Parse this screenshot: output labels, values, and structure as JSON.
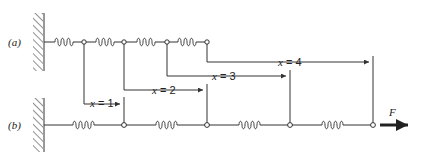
{
  "diagram": {
    "type": "spring-chain",
    "row_a": {
      "label": "(a)",
      "springs": 4,
      "nodes": 4
    },
    "row_b": {
      "label": "(b)",
      "springs": 4,
      "nodes": 4,
      "force_label": "F"
    },
    "dimensions": [
      {
        "label_var": "x",
        "label_eq": " = 1"
      },
      {
        "label_var": "x",
        "label_eq": " = 2"
      },
      {
        "label_var": "x",
        "label_eq": " = 3"
      },
      {
        "label_var": "x",
        "label_eq": " = 4"
      }
    ],
    "colors": {
      "line": "#333333",
      "background": "#ffffff"
    }
  }
}
